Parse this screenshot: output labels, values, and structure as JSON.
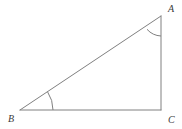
{
  "figure": {
    "type": "geometry-diagram",
    "shape": "right-triangle",
    "background_color": "#ffffff",
    "stroke_color": "#808080",
    "label_color": "#3a3a3a",
    "stroke_width": 1,
    "canvas": {
      "width": 182,
      "height": 129
    }
  },
  "vertices": [
    {
      "name": "A",
      "label": "A",
      "x": 161,
      "y": 16,
      "label_x": 168,
      "label_y": 12
    },
    {
      "name": "B",
      "label": "B",
      "x": 20,
      "y": 110,
      "label_x": 11,
      "label_y": 122
    },
    {
      "name": "C",
      "label": "C",
      "x": 161,
      "y": 110,
      "label_x": 168,
      "label_y": 123
    }
  ],
  "edges": [
    {
      "name": "AB",
      "from": "A",
      "to": "B",
      "role": "hypotenuse"
    },
    {
      "name": "BC",
      "from": "B",
      "to": "C",
      "role": "base"
    },
    {
      "name": "CA",
      "from": "C",
      "to": "A",
      "role": "vertical-leg"
    }
  ],
  "angle_marks": [
    {
      "name": "angle-A",
      "at": "A",
      "radius": 20,
      "style": "single-arc"
    },
    {
      "name": "angle-B",
      "at": "B",
      "radius": 33,
      "style": "single-arc"
    }
  ],
  "paths": {
    "hypotenuse": "M 20 110 L 161 16",
    "base": "M 20 110 L 161 110",
    "vertical_leg": "M 161 16 L 161 110",
    "arc_a": "M 147.0 29.3 A 20 20 0 0 0 161 36",
    "arc_b": "M 53 110 A 33 33 0 0 0 47.5 91.7"
  }
}
